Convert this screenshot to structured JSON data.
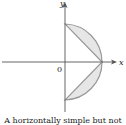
{
  "figure": {
    "axis_labels": {
      "x": "x",
      "y": "y",
      "origin": "0"
    },
    "caption": "A horizontally simple but not",
    "colors": {
      "axis": "#555555",
      "boundary": "#999999",
      "fill": "#e6e6e6"
    }
  }
}
